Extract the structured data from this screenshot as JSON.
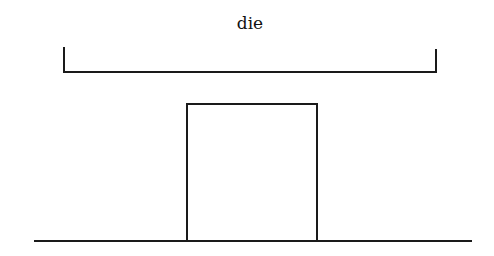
{
  "diagram": {
    "label": "die",
    "elements": [
      {
        "type": "bracket",
        "name": "die-width-bracket",
        "x1": 64,
        "x2": 436,
        "top": 48,
        "bottom": 72
      },
      {
        "type": "rectangle",
        "name": "die-block",
        "x": 187,
        "y": 104,
        "width": 130,
        "height": 137
      },
      {
        "type": "line",
        "name": "baseline",
        "x1": 35,
        "x2": 471,
        "y": 241
      }
    ],
    "stroke_color": "#1a1a1a"
  }
}
